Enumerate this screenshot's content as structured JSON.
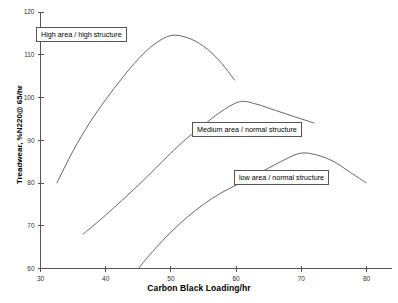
{
  "chart_data": {
    "type": "line",
    "title": "",
    "xlabel": "Carbon Black Loading/hr",
    "ylabel": "Treadwear, %N220@ 65/hr",
    "xlim": [
      30,
      80
    ],
    "ylim": [
      60,
      120
    ],
    "xticks": [
      30,
      40,
      50,
      60,
      70,
      80
    ],
    "yticks": [
      60,
      70,
      80,
      90,
      100,
      110,
      120
    ],
    "grid": false,
    "legend": "inline-annotation-boxes",
    "series": [
      {
        "name": "High area / high structure",
        "x": [
          32.5,
          35,
          37.5,
          40,
          42.5,
          45,
          47.5,
          50,
          52.5,
          55,
          57.5,
          59.8
        ],
        "y": [
          80.0,
          87.5,
          94.0,
          99.5,
          104.5,
          109.0,
          112.5,
          114.5,
          114.0,
          112.0,
          108.5,
          104.0
        ]
      },
      {
        "name": "Medium area / normal structure",
        "x": [
          36.5,
          40,
          45,
          50,
          52.5,
          55,
          57.5,
          60.5,
          63,
          66,
          69,
          72
        ],
        "y": [
          68.0,
          72.5,
          79.5,
          87.0,
          90.5,
          93.5,
          96.5,
          99.0,
          98.5,
          97.0,
          95.5,
          94.0
        ]
      },
      {
        "name": "low area / normal structure",
        "x": [
          45,
          47.5,
          50,
          52.5,
          55,
          57.5,
          60,
          62.5,
          65,
          67.5,
          70,
          72.5,
          75,
          77.5,
          80
        ],
        "y": [
          60.0,
          64.5,
          68.5,
          72.0,
          75.0,
          77.5,
          79.5,
          81.5,
          83.5,
          85.5,
          87.0,
          86.5,
          85.0,
          82.5,
          80.0
        ]
      }
    ],
    "annotations": [
      {
        "id": "high",
        "text": "High area / high structure"
      },
      {
        "id": "medium",
        "text": "Medium area / normal structure"
      },
      {
        "id": "low",
        "text": "low area / normal structure"
      }
    ]
  },
  "tick_labels": {
    "x": [
      "30",
      "40",
      "50",
      "60",
      "70",
      "80"
    ],
    "y": [
      "60",
      "70",
      "80",
      "90",
      "100",
      "110",
      "120"
    ]
  }
}
